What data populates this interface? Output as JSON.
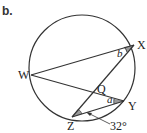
{
  "part_label": "b.",
  "points": {
    "X": "X",
    "W": "W",
    "Q": "Q",
    "Y": "Y",
    "Z": "Z"
  },
  "angles": {
    "b": "b",
    "a": "a",
    "given": "32°"
  },
  "colors": {
    "stroke": "#333333",
    "shade": "#999999"
  }
}
